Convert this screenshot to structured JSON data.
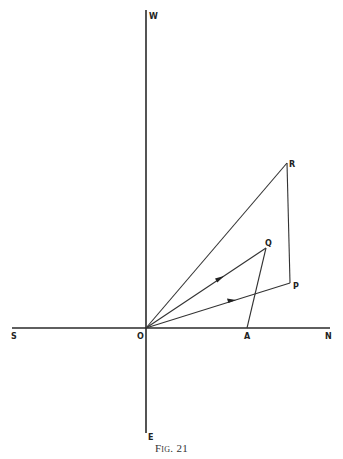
{
  "figure": {
    "caption": "Fig. 21",
    "axes": {
      "origin": {
        "label": "O",
        "x": 146,
        "y": 328
      },
      "north": {
        "label": "N",
        "x": 330,
        "y": 328
      },
      "south": {
        "label": "S",
        "x": 12,
        "y": 328
      },
      "west": {
        "label": "W",
        "x": 146,
        "y": 10
      },
      "east": {
        "label": "E",
        "x": 146,
        "y": 433
      }
    },
    "points": {
      "A": {
        "label": "A",
        "x": 247,
        "y": 328
      },
      "Q": {
        "label": "Q",
        "x": 266,
        "y": 248
      },
      "P": {
        "label": "P",
        "x": 290,
        "y": 283
      },
      "R": {
        "label": "R",
        "x": 287,
        "y": 163
      }
    },
    "segments": [
      {
        "from": "O",
        "to": "R",
        "arrow": false
      },
      {
        "from": "O",
        "to": "Q",
        "arrow": true
      },
      {
        "from": "O",
        "to": "P",
        "arrow": true
      },
      {
        "from": "A",
        "to": "Q",
        "arrow": false
      },
      {
        "from": "R",
        "to": "P",
        "arrow": false
      }
    ]
  }
}
